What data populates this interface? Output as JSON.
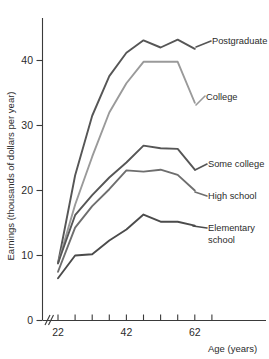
{
  "chart_data": {
    "type": "line",
    "title": "",
    "xlabel": "Age (years)",
    "ylabel": "Earnings (thousands of dollars per year)",
    "xlim": [
      22,
      67
    ],
    "ylim": [
      0,
      45
    ],
    "xticks": [
      22,
      27,
      32,
      37,
      42,
      47,
      52,
      57,
      62,
      67
    ],
    "xtick_labels": [
      "22",
      "",
      "",
      "",
      "42",
      "",
      "",
      "",
      "62",
      ""
    ],
    "yticks": [
      0,
      10,
      20,
      30,
      40
    ],
    "ytick_labels": [
      "0",
      "10",
      "20",
      "30",
      "40"
    ],
    "grid": false,
    "legend_position": "right-inline-labels",
    "axis_break": true,
    "x": [
      22,
      27,
      32,
      37,
      42,
      47,
      52,
      57,
      62
    ],
    "series": [
      {
        "name": "Postgraduate",
        "color": "#565656",
        "label": "Postgraduate",
        "values": [
          8.8,
          22.3,
          31.5,
          37.6,
          41.2,
          43.1,
          42.0,
          43.2,
          41.8
        ]
      },
      {
        "name": "College",
        "color": "#9a9a9a",
        "label": "College",
        "values": [
          8.8,
          17.8,
          25.2,
          32.0,
          36.5,
          39.8,
          39.8,
          39.8,
          33.5
        ]
      },
      {
        "name": "Some college",
        "color": "#565656",
        "label": "Some college",
        "values": [
          8.8,
          16.2,
          19.3,
          22.0,
          24.3,
          26.9,
          26.5,
          26.4,
          23.2
        ]
      },
      {
        "name": "High school",
        "color": "#6e6e6e",
        "label": "High school",
        "values": [
          7.5,
          14.3,
          17.6,
          20.2,
          23.1,
          22.9,
          23.2,
          22.4,
          20.0
        ]
      },
      {
        "name": "Elementary school",
        "color": "#4b4b4b",
        "label_line1": "Elementary",
        "label_line2": "school",
        "values": [
          6.5,
          10.0,
          10.2,
          12.3,
          14.0,
          16.3,
          15.2,
          15.2,
          14.6
        ]
      }
    ]
  },
  "axis": {
    "x_title": "Age (years)",
    "y_title": "Earnings (thousands of dollars per year)"
  },
  "labels": {
    "postgraduate": "Postgraduate",
    "college": "College",
    "some_college": "Some college",
    "high_school": "High school",
    "elementary_line1": "Elementary",
    "elementary_line2": "school"
  },
  "yticks": {
    "t0": "0",
    "t10": "10",
    "t20": "20",
    "t30": "30",
    "t40": "40"
  },
  "xticks": {
    "t22": "22",
    "t42": "42",
    "t62": "62"
  }
}
